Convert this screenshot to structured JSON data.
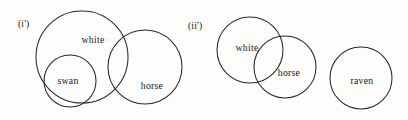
{
  "figure": {
    "background_color": "#fdfdfc",
    "stroke_color": "#2a2724",
    "text_color": "#242020",
    "panels": [
      {
        "tag": "(i')",
        "tag_x": 18,
        "tag_y": 27,
        "circles": [
          {
            "name": "white",
            "label": "white",
            "cx": 82,
            "cy": 57,
            "r": 46,
            "label_x": 93,
            "label_y": 43
          },
          {
            "name": "swan",
            "label": "swan",
            "cx": 70,
            "cy": 81,
            "r": 26,
            "label_x": 68,
            "label_y": 84
          },
          {
            "name": "horse",
            "label": "horse",
            "cx": 145,
            "cy": 67,
            "r": 37,
            "label_x": 152,
            "label_y": 89
          }
        ]
      },
      {
        "tag": "(ii')",
        "tag_x": 188,
        "tag_y": 29,
        "circles": [
          {
            "name": "white",
            "label": "white",
            "cx": 250,
            "cy": 50,
            "r": 33,
            "label_x": 247,
            "label_y": 51
          },
          {
            "name": "horse",
            "label": "horse",
            "cx": 285,
            "cy": 67,
            "r": 31,
            "label_x": 289,
            "label_y": 76
          },
          {
            "name": "raven",
            "label": "raven",
            "cx": 361,
            "cy": 78,
            "r": 31,
            "label_x": 362,
            "label_y": 84
          }
        ]
      }
    ]
  }
}
